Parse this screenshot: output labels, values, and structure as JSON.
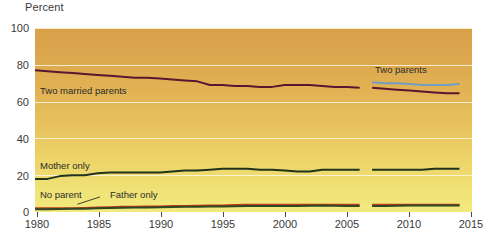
{
  "chart_data": {
    "type": "line",
    "title": "",
    "ylabel": "Percent",
    "xlabel": "",
    "ylim": [
      0,
      100
    ],
    "xlim": [
      1980,
      2015
    ],
    "yticks": [
      0,
      20,
      40,
      60,
      80,
      100
    ],
    "xticks": [
      1980,
      1985,
      1990,
      1995,
      2000,
      2005,
      2010,
      2015
    ],
    "grid": true,
    "legend": "inline-annotations",
    "note": "Series break between 2006 and 2007; 'Two married parents' measure replaced by 'Two parents'.",
    "series": [
      {
        "name": "Two married parents",
        "color": "#5a1530",
        "segment": "1980-2006",
        "x": [
          1980,
          1981,
          1982,
          1983,
          1984,
          1985,
          1986,
          1987,
          1988,
          1989,
          1990,
          1991,
          1992,
          1993,
          1994,
          1995,
          1996,
          1997,
          1998,
          1999,
          2000,
          2001,
          2002,
          2003,
          2004,
          2005,
          2006
        ],
        "values": [
          77,
          76.5,
          76,
          75.5,
          75,
          74.5,
          74,
          73.5,
          73,
          73,
          72.5,
          72,
          71.5,
          71,
          69,
          69,
          68.5,
          68.5,
          68,
          68,
          69,
          69,
          69,
          68.5,
          68,
          68,
          67.5
        ]
      },
      {
        "name": "Two parents",
        "color": "#5a1530",
        "segment": "2007-2014",
        "x": [
          2007,
          2008,
          2009,
          2010,
          2011,
          2012,
          2013,
          2014
        ],
        "values": [
          67.5,
          67,
          66.5,
          66,
          65.5,
          65,
          64.5,
          64.5
        ]
      },
      {
        "name": "Two parents (blue)",
        "color": "#6f9ec4",
        "segment": "2007-2014",
        "x": [
          2007,
          2008,
          2009,
          2010,
          2011,
          2012,
          2013,
          2014
        ],
        "values": [
          70.5,
          70,
          70,
          69.5,
          69,
          69,
          69,
          69.5
        ]
      },
      {
        "name": "Mother only",
        "color": "#20331c",
        "segment": "1980-2006",
        "x": [
          1980,
          1981,
          1982,
          1983,
          1984,
          1985,
          1986,
          1987,
          1988,
          1989,
          1990,
          1991,
          1992,
          1993,
          1994,
          1995,
          1996,
          1997,
          1998,
          1999,
          2000,
          2001,
          2002,
          2003,
          2004,
          2005,
          2006
        ],
        "values": [
          18,
          18,
          19.5,
          20,
          20,
          21,
          21.5,
          21.5,
          21.5,
          21.5,
          21.5,
          22,
          22.5,
          22.5,
          23,
          23.5,
          23.5,
          23.5,
          23,
          23,
          22.5,
          22,
          22,
          23,
          23,
          23,
          23
        ]
      },
      {
        "name": "Mother only",
        "color": "#20331c",
        "segment": "2007-2014",
        "x": [
          2007,
          2008,
          2009,
          2010,
          2011,
          2012,
          2013,
          2014
        ],
        "values": [
          23,
          23,
          23,
          23,
          23,
          23.5,
          23.5,
          23.5
        ]
      },
      {
        "name": "Father only",
        "color": "#c1391a",
        "segment": "1980-2006",
        "x": [
          1980,
          1981,
          1982,
          1983,
          1984,
          1985,
          1986,
          1987,
          1988,
          1989,
          1990,
          1991,
          1992,
          1993,
          1994,
          1995,
          1996,
          1997,
          1998,
          1999,
          2000,
          2001,
          2002,
          2003,
          2004,
          2005,
          2006
        ],
        "values": [
          2,
          2,
          2,
          2,
          2.2,
          2.5,
          2.6,
          2.8,
          2.8,
          3,
          3,
          3.2,
          3.3,
          3.4,
          3.5,
          3.6,
          3.8,
          4,
          4,
          4,
          4,
          4,
          4,
          4,
          4,
          4,
          4
        ]
      },
      {
        "name": "Father only",
        "color": "#c1391a",
        "segment": "2007-2014",
        "x": [
          2007,
          2008,
          2009,
          2010,
          2011,
          2012,
          2013,
          2014
        ],
        "values": [
          4,
          4,
          4,
          4,
          4,
          4,
          4,
          4
        ]
      },
      {
        "name": "No parent",
        "color": "#2d4a24",
        "segment": "1980-2006",
        "x": [
          1980,
          1981,
          1982,
          1983,
          1984,
          1985,
          1986,
          1987,
          1988,
          1989,
          1990,
          1991,
          1992,
          1993,
          1994,
          1995,
          1996,
          1997,
          1998,
          1999,
          2000,
          2001,
          2002,
          2003,
          2004,
          2005,
          2006
        ],
        "values": [
          1.5,
          1.5,
          1.6,
          1.7,
          1.8,
          2,
          2.2,
          2.3,
          2.4,
          2.5,
          2.6,
          2.7,
          2.8,
          2.9,
          3,
          3,
          3.1,
          3.2,
          3.2,
          3.2,
          3.2,
          3.2,
          3.4,
          3.6,
          3.4,
          3.2,
          3.2
        ]
      },
      {
        "name": "No parent",
        "color": "#2d4a24",
        "segment": "2007-2014",
        "x": [
          2007,
          2008,
          2009,
          2010,
          2011,
          2012,
          2013,
          2014
        ],
        "values": [
          3.2,
          3.3,
          3.4,
          3.6,
          3.6,
          3.6,
          3.6,
          3.6
        ]
      }
    ],
    "annotations": [
      {
        "text": "Two married parents",
        "x": 1980.5,
        "y": 66
      },
      {
        "text": "Two parents",
        "x": 2006.5,
        "y": 77
      },
      {
        "text": "Mother only",
        "x": 1980.5,
        "y": 26.5
      },
      {
        "text": "No parent",
        "x": 1980.5,
        "y": 8.5
      },
      {
        "text": "Father only",
        "x": 1985.5,
        "y": 10
      }
    ]
  },
  "axis": {
    "ylabel": "Percent",
    "yticks": [
      "100",
      "80",
      "60",
      "40",
      "20",
      "0"
    ],
    "xticks": [
      "1980",
      "1985",
      "1990",
      "1995",
      "2000",
      "2005",
      "2010",
      "2015"
    ]
  },
  "labels": {
    "two_married_parents": "Two married parents",
    "two_parents": "Two parents",
    "mother_only": "Mother only",
    "no_parent": "No parent",
    "father_only": "Father only"
  },
  "colors": {
    "two_married_parents": "#5a1530",
    "two_parents_blue": "#6f9ec4",
    "mother_only": "#20331c",
    "father_only": "#c1391a",
    "no_parent": "#2d4a24",
    "bg_top": "#d9a04a",
    "bg_bottom": "#f2ea7e",
    "gridline": "#fdf6e2"
  }
}
